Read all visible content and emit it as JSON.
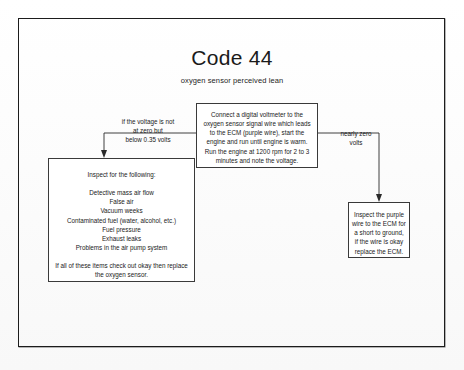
{
  "document": {
    "title": "Code 44",
    "subtitle": "oxygen sensor perceived lean"
  },
  "nodes": {
    "test": {
      "text": "Connect a digital voltmeter to the oxygen sensor signal wire which leads to the ECM (purple wire), start the engine and run until engine is warm. Run the engine at 1200 rpm for 2 to 3 minutes and note the voltage."
    },
    "inspect_list": {
      "lead": "Inspect for the following:",
      "items": [
        "Detective mass air flow",
        "False air",
        "Vacuum weeks",
        "Contaminated fuel (water, alcohol, etc.)",
        "Fuel pressure",
        "Exhaust leaks",
        "Problems in the air pump system"
      ],
      "tail": "If all of these items check out okay then replace the oxygen sensor."
    },
    "ecm": {
      "text": "Inspect the purple wire to the ECM for a short to ground, if the wire is okay replace the ECM."
    }
  },
  "edges": {
    "left_label": "if the voltage is not at zero but below 0.35 volts",
    "left_label_lines": [
      "if the voltage is not",
      "at zero but",
      "below 0.35 volts"
    ],
    "right_label": "nearly zero volts",
    "right_label_lines": [
      "nearly zero",
      "volts"
    ]
  },
  "colors": {
    "ink": "#1a1a1a",
    "rule": "#2a2a2a",
    "paper": "#ffffff",
    "border": "#1c1c1c"
  }
}
